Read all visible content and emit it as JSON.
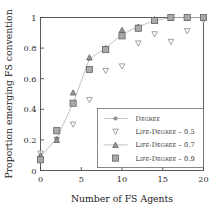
{
  "chart_data": {
    "type": "line",
    "title": "",
    "xlabel": "Number of FS Agents",
    "ylabel": "Proportion emerging FS convention",
    "x": [
      0,
      2,
      4,
      6,
      8,
      10,
      12,
      14,
      16,
      18,
      20
    ],
    "xlim": [
      0,
      20
    ],
    "ylim": [
      0,
      1
    ],
    "xticks": [
      "0",
      "5",
      "10",
      "15",
      "20"
    ],
    "xtick_values": [
      0,
      5,
      10,
      15,
      20
    ],
    "yticks": [
      "0",
      "0.2",
      "0.4",
      "0.6",
      "0.8",
      "1"
    ],
    "ytick_values": [
      0,
      0.2,
      0.4,
      0.6,
      0.8,
      1
    ],
    "grid": false,
    "legend_position": "lower-right",
    "series": [
      {
        "name": "Degree",
        "marker": "dot",
        "connected": true,
        "values": [
          0.09,
          0.21,
          0.44,
          0.73,
          0.8,
          0.89,
          0.94,
          0.98,
          1.0,
          1.0,
          1.0
        ]
      },
      {
        "name": "Life-Degree – 0.5",
        "marker": "triangle-down",
        "connected": false,
        "values": [
          0.11,
          0.2,
          0.3,
          0.46,
          0.65,
          0.68,
          0.83,
          0.89,
          0.84,
          0.91,
          0.98
        ]
      },
      {
        "name": "Life-Degree – 0.7",
        "marker": "triangle-up",
        "connected": false,
        "values": [
          0.1,
          0.2,
          0.51,
          0.74,
          0.8,
          0.92,
          0.94,
          0.99,
          1.0,
          1.0,
          1.0
        ]
      },
      {
        "name": "Life-Degree – 0.9",
        "marker": "square",
        "connected": false,
        "values": [
          0.07,
          0.26,
          0.44,
          0.66,
          0.79,
          0.88,
          0.93,
          0.98,
          1.0,
          1.0,
          1.0
        ]
      }
    ],
    "colors": {
      "marker_fill": "#a9a9a9",
      "marker_edge": "#585858",
      "line": "#b4b4b4",
      "axis": "#4a4a4a",
      "text": "#2b2b2b",
      "background": "#ffffff"
    }
  }
}
